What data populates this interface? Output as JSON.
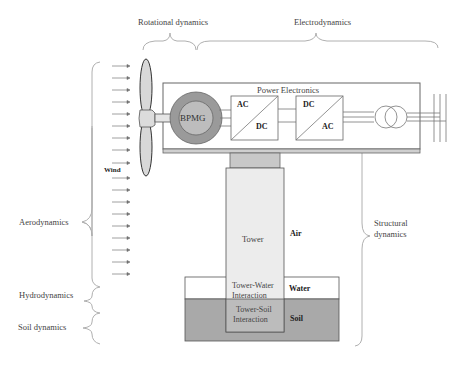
{
  "top_labels": {
    "rotational": "Rotational dynamics",
    "electro": "Electrodynamics"
  },
  "left_labels": {
    "aero": "Aerodynamics",
    "hydro": "Hydrodynamics",
    "soil": "Soil dynamics"
  },
  "right_labels": {
    "structural_1": "Structural",
    "structural_2": "dynamics"
  },
  "nacelle": {
    "title": "Power Electronics",
    "generator": "BPMG",
    "converter1_top": "AC",
    "converter1_bottom": "DC",
    "converter2_top": "DC",
    "converter2_bottom": "AC"
  },
  "wind_label": "Wind",
  "tower": {
    "label": "Tower",
    "water_interaction_1": "Tower-Water",
    "water_interaction_2": "Interaction",
    "soil_interaction_1": "Tower-Soil",
    "soil_interaction_2": "Interaction"
  },
  "media": {
    "air": "Air",
    "water": "Water",
    "soil": "Soil"
  },
  "colors": {
    "soil_fill": "#a9a9a9",
    "tower_fill": "#ececec",
    "generator_outer": "#9a9a9a",
    "generator_inner": "#bdbdbd",
    "blade_fill": "#d8d8d8",
    "brace": "#b0b0b0"
  }
}
